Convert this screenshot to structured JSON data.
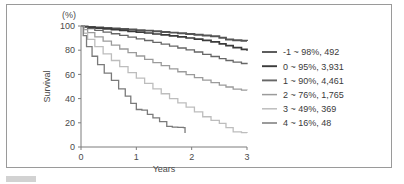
{
  "figure": {
    "unit_label": "(%)",
    "caption_bar": "caption-marker"
  },
  "chart_data": {
    "type": "line",
    "title": "",
    "subtitle": "",
    "xlabel": "Years",
    "ylabel": "Survival",
    "unit_label": "(%)",
    "xlim": [
      0,
      3
    ],
    "ylim": [
      0,
      100
    ],
    "xticks": [
      "0",
      "1",
      "2",
      "3"
    ],
    "yticks": [
      "0",
      "20",
      "40",
      "60",
      "80",
      "100"
    ],
    "grid": false,
    "legend_position": "right",
    "legend_entries": [
      {
        "group": "-1",
        "tilde": "~",
        "survival": "98%",
        "n": "492",
        "label": "-1 ~ 98%,  492",
        "color": "#555555"
      },
      {
        "group": "0",
        "tilde": "~",
        "survival": "95%",
        "n": "3,931",
        "label": "0 ~ 95%,  3,931",
        "color": "#3b3b3b"
      },
      {
        "group": "1",
        "tilde": "~",
        "survival": "90%",
        "n": "4,461",
        "label": "1 ~ 90%,  4,461",
        "color": "#676767"
      },
      {
        "group": "2",
        "tilde": "~",
        "survival": "76%",
        "n": "1,765",
        "label": "2 ~ 76%,  1,765",
        "color": "#9b9b9b"
      },
      {
        "group": "3",
        "tilde": "~",
        "survival": "49%",
        "n": "369",
        "label": "3 ~ 49%,  369",
        "color": "#bdbdbd"
      },
      {
        "group": "4",
        "tilde": "~",
        "survival": "16%",
        "n": "48",
        "label": "4 ~ 16%,  48",
        "color": "#7a7a7a"
      }
    ],
    "series": [
      {
        "name": "-1 ~ 98%, 492",
        "color": "#555555",
        "width": 1.9,
        "x": [
          0,
          0.05,
          0.12,
          0.25,
          0.4,
          0.55,
          0.7,
          0.85,
          1.0,
          1.15,
          1.3,
          1.45,
          1.6,
          1.75,
          1.9,
          2.05,
          2.2,
          2.35,
          2.5,
          2.62,
          2.75,
          2.9,
          3.0
        ],
        "y": [
          100,
          99.6,
          99.2,
          98.8,
          98.4,
          98.0,
          97.5,
          97.1,
          96.6,
          96.2,
          95.6,
          95.1,
          94.5,
          94.0,
          93.4,
          92.8,
          92.2,
          91.5,
          90.3,
          88.8,
          88.2,
          87.8,
          87.6
        ]
      },
      {
        "name": "0 ~ 95%, 3,931",
        "color": "#3b3b3b",
        "width": 1.7,
        "x": [
          0,
          0.05,
          0.12,
          0.25,
          0.4,
          0.55,
          0.7,
          0.85,
          1.0,
          1.15,
          1.3,
          1.45,
          1.6,
          1.75,
          1.9,
          2.05,
          2.2,
          2.35,
          2.5,
          2.62,
          2.75,
          2.9,
          3.0
        ],
        "y": [
          100,
          99.4,
          98.9,
          98.3,
          97.7,
          97.0,
          96.3,
          95.6,
          94.9,
          94.2,
          93.4,
          92.6,
          91.8,
          91.0,
          90.1,
          89.2,
          88.2,
          86.8,
          85.3,
          83.8,
          82.2,
          80.6,
          79.6
        ]
      },
      {
        "name": "1 ~ 90%, 4,461",
        "color": "#676767",
        "width": 1.3,
        "x": [
          0,
          0.05,
          0.12,
          0.25,
          0.4,
          0.55,
          0.7,
          0.85,
          1.0,
          1.15,
          1.3,
          1.45,
          1.6,
          1.75,
          1.9,
          2.05,
          2.2,
          2.35,
          2.5,
          2.62,
          2.75,
          2.9,
          3.0
        ],
        "y": [
          100,
          98.8,
          97.8,
          96.4,
          95.0,
          93.6,
          92.2,
          90.8,
          89.4,
          88.0,
          86.5,
          85.0,
          83.4,
          81.8,
          80.2,
          78.5,
          76.6,
          74.8,
          73.0,
          71.5,
          70.2,
          69.0,
          68.4
        ]
      },
      {
        "name": "2 ~ 76%, 1,765",
        "color": "#9b9b9b",
        "width": 1.3,
        "x": [
          0,
          0.05,
          0.12,
          0.25,
          0.4,
          0.55,
          0.7,
          0.85,
          1.0,
          1.15,
          1.3,
          1.45,
          1.6,
          1.75,
          1.9,
          2.05,
          2.2,
          2.35,
          2.5,
          2.62,
          2.75,
          2.9,
          3.0
        ],
        "y": [
          100,
          97.0,
          94.5,
          91.0,
          87.5,
          84.2,
          81.0,
          78.0,
          75.2,
          72.4,
          69.8,
          67.2,
          64.6,
          62.2,
          59.8,
          57.4,
          55.2,
          53.2,
          51.2,
          49.6,
          47.8,
          47.0,
          46.8
        ]
      },
      {
        "name": "3 ~ 49%, 369",
        "color": "#bdbdbd",
        "width": 1.3,
        "x": [
          0,
          0.05,
          0.12,
          0.25,
          0.4,
          0.55,
          0.7,
          0.85,
          1.0,
          1.15,
          1.3,
          1.45,
          1.6,
          1.75,
          1.9,
          2.05,
          2.2,
          2.35,
          2.5,
          2.62,
          2.75,
          2.9,
          3.0
        ],
        "y": [
          100,
          94.0,
          89.0,
          83.0,
          77.0,
          71.5,
          66.5,
          61.5,
          57.0,
          52.5,
          48.0,
          44.0,
          40.0,
          36.5,
          33.0,
          29.0,
          25.0,
          22.0,
          19.5,
          16.0,
          12.5,
          11.8,
          11.6
        ]
      },
      {
        "name": "4 ~ 16%, 48",
        "color": "#7a7a7a",
        "width": 1.3,
        "x": [
          0,
          0.04,
          0.1,
          0.2,
          0.3,
          0.42,
          0.55,
          0.68,
          0.8,
          0.9,
          1.0,
          1.1,
          1.2,
          1.3,
          1.42,
          1.55,
          1.65,
          1.75,
          1.85,
          1.88
        ],
        "y": [
          100,
          92.0,
          83.0,
          75.0,
          68.0,
          61.0,
          55.0,
          48.0,
          42.0,
          36.0,
          31.0,
          30.5,
          27.0,
          24.0,
          21.0,
          17.0,
          16.5,
          16.2,
          16.0,
          11.5
        ]
      }
    ]
  }
}
